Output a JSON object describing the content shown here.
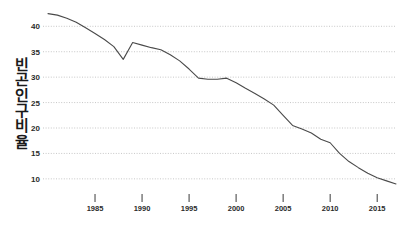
{
  "chart_data": {
    "type": "line",
    "title": "",
    "subtitle": "",
    "xlabel": "",
    "ylabel": "빈곤인구비율",
    "ylabel_chars": [
      "빈",
      "곤",
      "인",
      "구",
      "비",
      "율"
    ],
    "xlim": [
      1980,
      2017
    ],
    "ylim": [
      8.2,
      43.6
    ],
    "ytick_values": [
      40,
      35,
      30,
      25,
      20,
      15,
      10
    ],
    "ytick_labels": [
      "40",
      "35",
      "30",
      "25",
      "20",
      "15",
      "10"
    ],
    "xtick_values": [
      1985,
      1990,
      1995,
      2000,
      2005,
      2010,
      2015
    ],
    "xtick_labels": [
      "1985",
      "1990",
      "1995",
      "2000",
      "2005",
      "2010",
      "2015"
    ],
    "grid": true,
    "grid_axis": "y",
    "grid_style": "dotted",
    "grid_color": "#b9b9b9",
    "legend": false,
    "legend_position": "none",
    "line_color": "#4a4a4a",
    "line_width": 1.1,
    "background_color": "#ffffff",
    "x": [
      1980,
      1981,
      1982,
      1983,
      1984,
      1985,
      1986,
      1987,
      1988,
      1989,
      1990,
      1991,
      1992,
      1993,
      1994,
      1995,
      1996,
      1997,
      1998,
      1999,
      2000,
      2001,
      2002,
      2003,
      2004,
      2005,
      2006,
      2007,
      2008,
      2009,
      2010,
      2011,
      2012,
      2013,
      2014,
      2015,
      2016,
      2017
    ],
    "values": [
      42.5,
      42.2,
      41.6,
      40.8,
      39.7,
      38.6,
      37.4,
      36.0,
      33.5,
      36.8,
      36.3,
      35.8,
      35.4,
      34.4,
      33.2,
      31.6,
      29.8,
      29.6,
      29.6,
      29.8,
      28.9,
      27.8,
      26.8,
      25.7,
      24.5,
      22.5,
      20.5,
      19.8,
      19.0,
      17.8,
      17.1,
      15.0,
      13.4,
      12.2,
      11.1,
      10.2,
      9.6,
      9.0
    ]
  }
}
